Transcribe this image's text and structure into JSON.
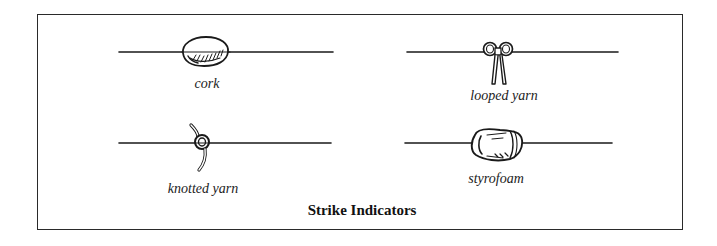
{
  "figure": {
    "title": "Strike Indicators",
    "indicators": [
      {
        "id": "cork",
        "label": "cork",
        "icon": "cork-bead-icon",
        "position": "top-left"
      },
      {
        "id": "looped-yarn",
        "label": "looped yarn",
        "icon": "looped-yarn-icon",
        "position": "top-right"
      },
      {
        "id": "knotted-yarn",
        "label": "knotted yarn",
        "icon": "knotted-yarn-icon",
        "position": "bottom-left"
      },
      {
        "id": "styrofoam",
        "label": "styrofoam",
        "icon": "styrofoam-bead-icon",
        "position": "bottom-right"
      }
    ]
  },
  "colors": {
    "ink": "#1a1a1a",
    "background": "#ffffff",
    "frame": "#2a2a2a"
  }
}
